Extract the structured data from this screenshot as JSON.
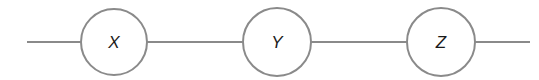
{
  "diagram": {
    "type": "chain",
    "stroke_color": "#8a8a8a",
    "text_color": "#1a1a1a",
    "background": "#ffffff",
    "nodes": [
      {
        "label": "X",
        "cx": 114,
        "cy": 42,
        "r": 33
      },
      {
        "label": "Y",
        "cx": 277,
        "cy": 42,
        "r": 34
      },
      {
        "label": "Z",
        "cx": 441,
        "cy": 42,
        "r": 34
      }
    ],
    "edges": [
      {
        "from": "start",
        "to": "X",
        "x1": 27,
        "x2": 81
      },
      {
        "from": "X",
        "to": "Y",
        "x1": 147,
        "x2": 243
      },
      {
        "from": "Y",
        "to": "Z",
        "x1": 311,
        "x2": 407
      },
      {
        "from": "Z",
        "to": "end",
        "x1": 475,
        "x2": 530
      }
    ]
  }
}
